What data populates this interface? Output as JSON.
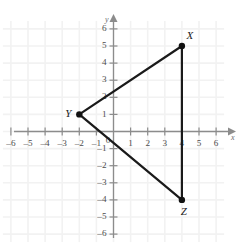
{
  "chart_data": {
    "type": "scatter",
    "title": "",
    "xlabel": "x",
    "ylabel": "y",
    "xlim": [
      -6,
      6
    ],
    "ylim": [
      -6,
      6
    ],
    "grid": true,
    "legend": "none",
    "x_ticks": [
      -6,
      -5,
      -4,
      -3,
      -2,
      -1,
      1,
      2,
      3,
      4,
      5,
      6
    ],
    "y_ticks": [
      6,
      5,
      4,
      3,
      2,
      1,
      -1,
      -2,
      -3,
      -4,
      -5,
      -6
    ],
    "x_tick_labels": [
      "-6",
      "-5",
      "-4",
      "-3",
      "-2",
      "-1",
      "1",
      "2",
      "3",
      "4",
      "5",
      "6"
    ],
    "y_tick_labels": [
      "6",
      "5",
      "4",
      "3",
      "2",
      "1",
      "-1",
      "-2",
      "-3",
      "-4",
      "-5",
      "-6"
    ],
    "origin_label": "0",
    "points": [
      {
        "label": "X",
        "x": 4,
        "y": 5
      },
      {
        "label": "Y",
        "x": -2,
        "y": 1
      },
      {
        "label": "Z",
        "x": 4,
        "y": -4
      }
    ],
    "edges": [
      {
        "name": "edge-YX",
        "from": "Y",
        "to": "X"
      },
      {
        "name": "edge-XZ",
        "from": "X",
        "to": "Z"
      },
      {
        "name": "edge-ZY",
        "from": "Z",
        "to": "Y"
      }
    ],
    "colors": {
      "shape_stroke": "#1a1a1a",
      "vertex_fill": "#111111",
      "axis": "#8c8c8c",
      "grid": "#f2f2f2",
      "background": "#ffffff",
      "tick_text": "#4d4d4d"
    }
  },
  "axis_names": {
    "x": "x",
    "y": "y"
  },
  "vertex_labels": {
    "x_point": "X",
    "y_point": "Y",
    "z_point": "Z"
  }
}
